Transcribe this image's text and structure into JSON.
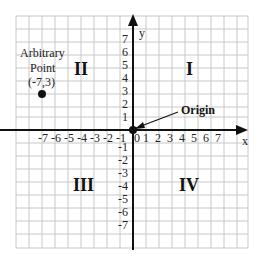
{
  "diagram": {
    "axes": {
      "x_label": "x",
      "y_label": "y",
      "x_ticks_negative": "-7 -6 -5 -4 -3 -2 -1",
      "x_ticks_positive": "0 1  2  3  4  5  6  7",
      "y_ticks": [
        "7",
        "6",
        "5",
        "4",
        "3",
        "2",
        "1",
        "-1",
        "-2",
        "-3",
        "-4",
        "-5",
        "-6",
        "-7"
      ]
    },
    "quadrants": {
      "q1": "I",
      "q2": "II",
      "q3": "III",
      "q4": "IV"
    },
    "point": {
      "line1": "Arbitrary",
      "line2": "Point",
      "line3": "(-7,3)",
      "x": -7,
      "y": 3
    },
    "origin_label": "Origin"
  }
}
